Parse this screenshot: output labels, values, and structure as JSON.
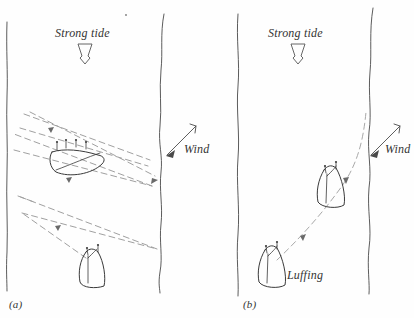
{
  "figure": {
    "title_caption_a": "(a)",
    "title_caption_b": "(b)",
    "background_color": "#fefefe",
    "ink_color": "#3a3a3a",
    "dash_color": "#9a9a9a"
  },
  "panel_a": {
    "caption": "(a)",
    "tide_label": "Strong tide",
    "wind_label": "Wind",
    "tide_direction": "down",
    "wind_direction": "down-left",
    "boats": [
      {
        "name": "heeled-boat",
        "state": "heeled-over",
        "x": 75,
        "y": 163
      },
      {
        "name": "upright-boat",
        "state": "upright",
        "x": 92,
        "y": 268
      }
    ],
    "track_type": "zigzag-tacking",
    "track_style": "dashed"
  },
  "panel_b": {
    "caption": "(b)",
    "tide_label": "Strong tide",
    "wind_label": "Wind",
    "luffing_label": "Luffing",
    "tide_direction": "down",
    "wind_direction": "down-left",
    "boats": [
      {
        "name": "upper-boat",
        "state": "upright",
        "x": 330,
        "y": 182
      },
      {
        "name": "lower-boat",
        "state": "luffing",
        "x": 272,
        "y": 262
      }
    ],
    "track_type": "direct-curved",
    "track_style": "dashed"
  },
  "icons": {
    "tide_arrow": "hollow-down-arrow-icon",
    "wind_arrow": "barbed-arrow-icon",
    "boat_heeled": "heeled-sailboat-icon",
    "boat_upright": "upright-sailboat-icon",
    "direction_marker": "small-arrowhead-icon"
  }
}
